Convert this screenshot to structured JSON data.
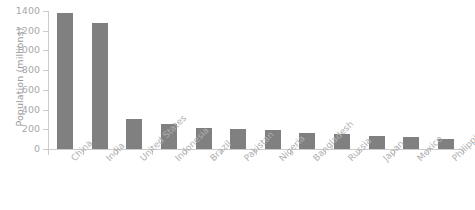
{
  "chart_data": {
    "type": "bar",
    "title": "",
    "subtitle": "",
    "xlabel": "",
    "ylabel": "Population (millions)",
    "categories": [
      "China",
      "India",
      "United States",
      "Indonesia",
      "Brazil",
      "Pakistan",
      "Nigeria",
      "Bangladesh",
      "Russia",
      "Japan",
      "Mexico",
      "Philippines"
    ],
    "values": [
      1380,
      1280,
      300,
      255,
      215,
      205,
      195,
      160,
      155,
      130,
      125,
      105
    ],
    "ylim": [
      0,
      1400
    ],
    "yticks": [
      0,
      200,
      400,
      600,
      800,
      1000,
      1200,
      1400
    ],
    "ytick_labels": [
      "0",
      "200",
      "400",
      "600",
      "800",
      "1000",
      "1200",
      "1400"
    ],
    "grid": false,
    "legend": false,
    "legend_position": "none",
    "bar_color": "#808080",
    "axis_color": "#cccccc",
    "tick_label_color": "#a8a8a8",
    "category_label_color": "#b0b0b0",
    "category_label_rotation": -45,
    "background_color": "#ffffff"
  }
}
